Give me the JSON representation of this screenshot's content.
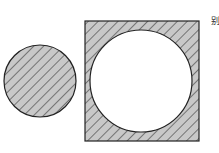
{
  "figure": {
    "label": "别",
    "shapes": [
      {
        "type": "circle",
        "name": "shaded-circle",
        "cx": 40,
        "cy": 81,
        "r": 36,
        "fill": "hatched"
      },
      {
        "type": "square-with-circular-hole",
        "name": "shaded-square",
        "x": 85,
        "y": 21,
        "size": 114,
        "hole": {
          "cx": 141,
          "cy": 81,
          "r": 51
        },
        "fill": "hatched"
      }
    ],
    "colors": {
      "hatch_bg": "#c8c8c8",
      "hatch_line": "#333333",
      "stroke": "#222222"
    }
  }
}
